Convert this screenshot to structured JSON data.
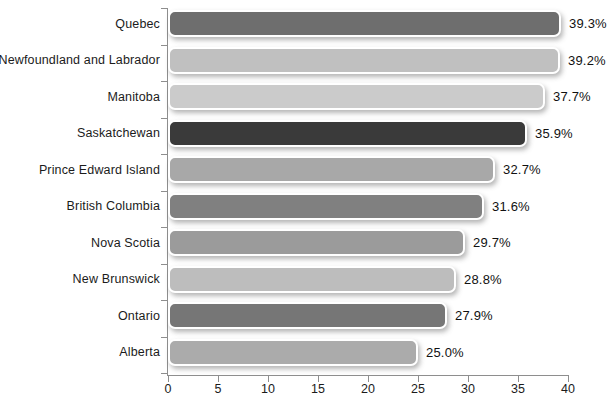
{
  "chart_data": {
    "type": "bar",
    "orientation": "horizontal",
    "title": "",
    "xlabel": "",
    "ylabel": "",
    "xlim": [
      0,
      40
    ],
    "xticks": [
      0,
      5,
      10,
      15,
      20,
      25,
      30,
      35,
      40
    ],
    "xtick_labels": [
      "0",
      "5",
      "10",
      "15",
      "20",
      "25",
      "30",
      "35",
      "40"
    ],
    "grid": false,
    "legend": "none",
    "value_suffix": "%",
    "categories": [
      "Quebec",
      "Newfoundland and Labrador",
      "Manitoba",
      "Saskatchewan",
      "Prince Edward Island",
      "British Columbia",
      "Nova Scotia",
      "New Brunswick",
      "Ontario",
      "Alberta"
    ],
    "values": [
      39.3,
      39.2,
      37.7,
      35.9,
      32.7,
      31.6,
      29.7,
      28.8,
      27.9,
      25.0
    ],
    "value_labels": [
      "39.3%",
      "39.2%",
      "37.7%",
      "35.9%",
      "32.7%",
      "31.6%",
      "29.7%",
      "28.8%",
      "27.9%",
      "25.0%"
    ],
    "bar_colors": [
      "#6e6e6e",
      "#c0c0c0",
      "#cbcbcb",
      "#3a3a3a",
      "#a8a8a8",
      "#808080",
      "#9b9b9b",
      "#bdbdbd",
      "#767676",
      "#ababab"
    ]
  }
}
